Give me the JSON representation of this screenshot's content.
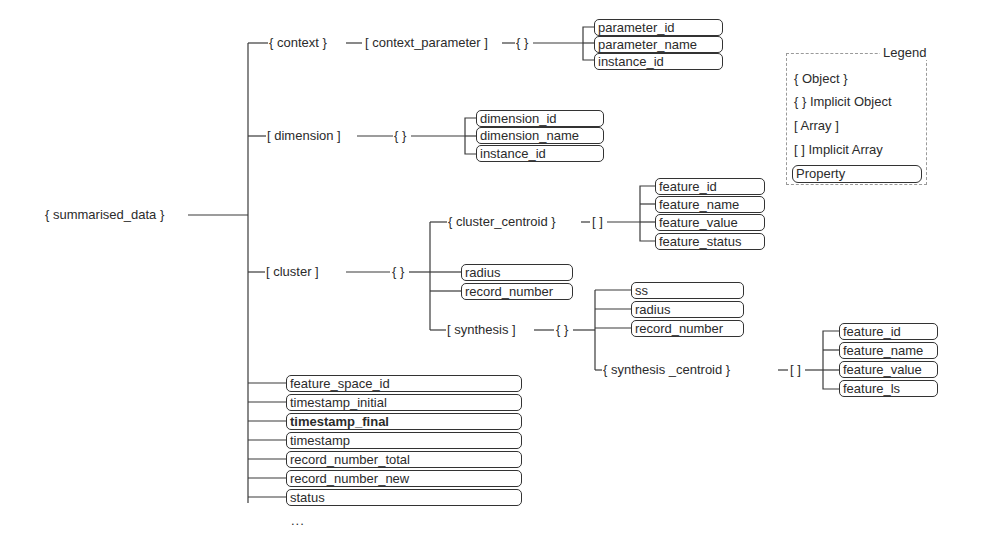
{
  "diagram": {
    "root": "{ summarised_data }",
    "branches": {
      "context": {
        "label": "{ context }",
        "child": "[ context_parameter ]",
        "implicit": "{ }",
        "properties": [
          "parameter_id",
          "parameter_name",
          "instance_id"
        ]
      },
      "dimension": {
        "label": "[ dimension ]",
        "implicit": "{ }",
        "properties": [
          "dimension_id",
          "dimension_name",
          "instance_id"
        ]
      },
      "cluster": {
        "label": "[ cluster ]",
        "implicit": "{ }",
        "cluster_centroid": {
          "label": "{ cluster_centroid }",
          "implicit": "[ ]",
          "properties": [
            "feature_id",
            "feature_name",
            "feature_value",
            "feature_status"
          ]
        },
        "properties": [
          "radius",
          "record_number"
        ],
        "synthesis": {
          "label": "[ synthesis ]",
          "implicit": "{ }",
          "properties": [
            "ss",
            "radius",
            "record_number"
          ],
          "synthesis_centroid": {
            "label": "{ synthesis _centroid }",
            "implicit": "[ ]",
            "properties": [
              "feature_id",
              "feature_name",
              "feature_value",
              "feature_ls"
            ]
          }
        }
      },
      "root_properties": [
        "feature_space_id",
        "timestamp_initial",
        "timestamp_final",
        "timestamp",
        "record_number_total",
        "record_number_new",
        "status"
      ],
      "more": "..."
    }
  },
  "legend": {
    "title": "Legend",
    "items": [
      "{ Object }",
      "{ } Implicit Object",
      "[ Array ]",
      "[ ] Implicit Array"
    ],
    "property_label": "Property"
  }
}
